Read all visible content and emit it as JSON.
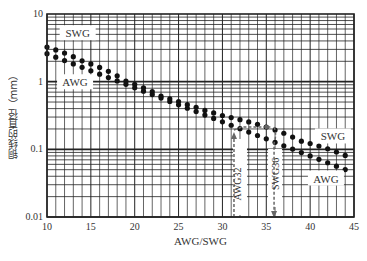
{
  "chart_data": {
    "type": "scatter",
    "title": "",
    "xlabel": "AWG/SWG",
    "ylabel": "铜线的直径（mm）",
    "xlim": [
      10,
      45
    ],
    "ylim": [
      0.01,
      10
    ],
    "yscale": "log",
    "grid": true,
    "x_ticks": [
      10,
      15,
      20,
      25,
      30,
      35,
      40,
      45
    ],
    "y_ticks": [
      {
        "value": 10,
        "label": "10"
      },
      {
        "value": 1,
        "label": "1"
      },
      {
        "value": 0.1,
        "label": "0.1"
      },
      {
        "value": 0.01,
        "label": "0.01"
      }
    ],
    "x": [
      10,
      11,
      12,
      13,
      14,
      15,
      16,
      17,
      18,
      19,
      20,
      21,
      22,
      23,
      24,
      25,
      26,
      27,
      28,
      29,
      30,
      31,
      32,
      33,
      34,
      35,
      36,
      37,
      38,
      39,
      40,
      41,
      42,
      43,
      44
    ],
    "series": [
      {
        "name": "SWG",
        "values": [
          3.251,
          2.946,
          2.642,
          2.337,
          2.032,
          1.829,
          1.626,
          1.422,
          1.219,
          1.016,
          0.914,
          0.813,
          0.711,
          0.61,
          0.559,
          0.508,
          0.457,
          0.417,
          0.376,
          0.345,
          0.315,
          0.295,
          0.274,
          0.254,
          0.234,
          0.213,
          0.193,
          0.173,
          0.152,
          0.132,
          0.122,
          0.112,
          0.102,
          0.0914,
          0.0813
        ]
      },
      {
        "name": "AWG",
        "values": [
          2.588,
          2.305,
          2.053,
          1.828,
          1.628,
          1.45,
          1.291,
          1.15,
          1.024,
          0.912,
          0.812,
          0.723,
          0.644,
          0.573,
          0.511,
          0.455,
          0.405,
          0.361,
          0.321,
          0.286,
          0.255,
          0.227,
          0.202,
          0.18,
          0.16,
          0.143,
          0.127,
          0.113,
          0.101,
          0.0897,
          0.0799,
          0.0711,
          0.0633,
          0.0564,
          0.0502
        ]
      }
    ],
    "annotations": [
      {
        "text": "SWG",
        "x": 13.5,
        "y": 5.2,
        "series": "SWG"
      },
      {
        "text": "AWG",
        "x": 13.2,
        "y": 0.98,
        "series": "AWG"
      },
      {
        "text": "SWG",
        "x": 42.6,
        "y": 0.155,
        "series": "SWG"
      },
      {
        "text": "AWG",
        "x": 41.8,
        "y": 0.037,
        "series": "AWG"
      },
      {
        "text": "AWG32",
        "x": 32,
        "vertical": true
      },
      {
        "text": "SWG36",
        "x": 36,
        "vertical": true
      }
    ],
    "conversion_arrow": {
      "from_gauge": 32,
      "from_label": "AWG32",
      "to_gauge": 36,
      "to_label": "SWG36",
      "diameter": 0.2
    }
  },
  "colors": {
    "grid": "#222222",
    "points": "#111111",
    "text": "#333333",
    "dash": "#666666"
  }
}
